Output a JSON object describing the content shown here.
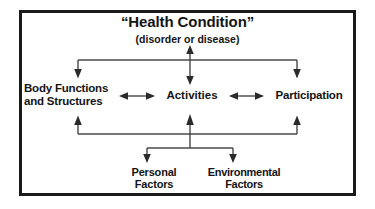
{
  "diagram": {
    "title": "“Health Condition”",
    "subtitle": "(disorder or disease)",
    "frame_color": "#1a1a1a",
    "line_color": "#3a3a3a",
    "text_color": "#141414",
    "background": "#ffffff",
    "nodes": {
      "health_condition": "“Health Condition”",
      "health_subtitle": "(disorder or disease)",
      "body_functions": "Body Functions\nand Structures",
      "activities": "Activities",
      "participation": "Participation",
      "personal_factors": "Personal\nFactors",
      "environmental_factors": "Environmental\nFactors"
    },
    "connectors": [
      {
        "name": "health-to-activities",
        "from": "Health Condition",
        "to": "Activities",
        "style": "double-headed-vertical"
      },
      {
        "name": "health-bus-to-body-functions",
        "from": "Health Condition",
        "to": "Body Functions and Structures",
        "style": "single-headed-down"
      },
      {
        "name": "health-bus-to-participation",
        "from": "Health Condition",
        "to": "Participation",
        "style": "single-headed-down"
      },
      {
        "name": "body-functions-to-activities",
        "from": "Body Functions and Structures",
        "to": "Activities",
        "style": "double-headed-horizontal"
      },
      {
        "name": "activities-to-participation",
        "from": "Activities",
        "to": "Participation",
        "style": "double-headed-horizontal"
      },
      {
        "name": "factors-bus-to-body-functions",
        "from": "Personal and Environmental Factors",
        "to": "Body Functions and Structures",
        "style": "single-headed-up"
      },
      {
        "name": "factors-bus-to-activities",
        "from": "Personal and Environmental Factors",
        "to": "Activities",
        "style": "single-headed-up"
      },
      {
        "name": "factors-bus-to-participation",
        "from": "Personal and Environmental Factors",
        "to": "Participation",
        "style": "single-headed-up"
      },
      {
        "name": "bus-to-personal-factors",
        "from": "Contextual bus",
        "to": "Personal Factors",
        "style": "single-headed-down"
      },
      {
        "name": "bus-to-environmental-factors",
        "from": "Contextual bus",
        "to": "Environmental Factors",
        "style": "single-headed-down"
      }
    ]
  }
}
